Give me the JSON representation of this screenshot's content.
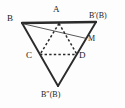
{
  "figure": {
    "canvas": {
      "width": 125,
      "height": 108,
      "background": "#fdfdfd"
    },
    "colors": {
      "solid_stroke": "#2b2b2b",
      "dashed_stroke": "#2b2b2b",
      "thin_stroke": "#3a3a3a",
      "label_text": "#1a1a1a"
    },
    "stroke_widths": {
      "outer_solid": 1.9,
      "top_edge": 2.3,
      "thin_line": 0.8,
      "dashed": 1.5
    },
    "points": {
      "B": {
        "label": "B",
        "x": 22,
        "y": 23,
        "label_x": 7,
        "label_y": 15
      },
      "Bprime": {
        "label": "B′(B)",
        "x": 96,
        "y": 22,
        "label_x": 90,
        "label_y": 13
      },
      "Bdprime": {
        "label": "B″(B)",
        "x": 58,
        "y": 86,
        "label_x": 42,
        "label_y": 92
      },
      "A": {
        "label": "A",
        "x": 59,
        "y": 22.5,
        "label_x": 54,
        "label_y": 6
      },
      "C": {
        "label": "C",
        "x": 40,
        "y": 54.5,
        "label_x": 26,
        "label_y": 52
      },
      "D": {
        "label": "D",
        "x": 77,
        "y": 54.5,
        "label_x": 79,
        "label_y": 52
      },
      "M": {
        "label": "M",
        "x": 86.5,
        "y": 38.5,
        "label_x": 88,
        "label_y": 36
      }
    },
    "segments": [
      {
        "name": "edge-B-Bprime-top",
        "from": "B",
        "to": "Bprime",
        "style": "solid",
        "weight": "heavy"
      },
      {
        "name": "edge-B-Bdprime",
        "from": "B",
        "to": "Bdprime",
        "style": "solid",
        "weight": "normal"
      },
      {
        "name": "edge-Bprime-Bdprime",
        "from": "Bprime",
        "to": "Bdprime",
        "style": "solid",
        "weight": "normal"
      },
      {
        "name": "line-B-to-M",
        "from": "B",
        "to": "M",
        "style": "solid",
        "weight": "thin"
      },
      {
        "name": "fold-A-to-C",
        "from": "A",
        "to": "C",
        "style": "dashed",
        "weight": "dashed"
      },
      {
        "name": "fold-A-to-D",
        "from": "A",
        "to": "D",
        "style": "dashed",
        "weight": "dashed"
      },
      {
        "name": "fold-C-to-D",
        "from": "C",
        "to": "D",
        "style": "dashed",
        "weight": "dashed"
      }
    ],
    "labels": [
      {
        "name": "label-B",
        "text": "B",
        "size": "normal"
      },
      {
        "name": "label-A",
        "text": "A",
        "size": "normal"
      },
      {
        "name": "label-Bprime",
        "text": "B′(B)",
        "size": "small"
      },
      {
        "name": "label-M",
        "text": "M",
        "size": "small"
      },
      {
        "name": "label-C",
        "text": "C",
        "size": "normal"
      },
      {
        "name": "label-D",
        "text": "D",
        "size": "normal"
      },
      {
        "name": "label-Bdprime",
        "text": "B″(B)",
        "size": "small"
      }
    ]
  }
}
